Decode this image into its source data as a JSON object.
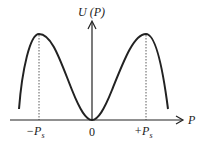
{
  "diagram": {
    "y_axis_label": "U (P)",
    "x_axis_label": "P",
    "ticks": {
      "left": "−P",
      "left_sub": "s",
      "origin": "0",
      "right": "+P",
      "right_sub": "s"
    },
    "colors": {
      "stroke": "#222222",
      "background": "#ffffff"
    }
  }
}
